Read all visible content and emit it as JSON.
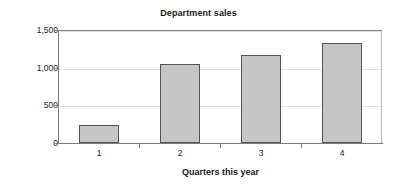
{
  "chart_data": {
    "type": "bar",
    "title": "Department sales",
    "xlabel": "Quarters this year",
    "ylabel": "Sales in thousands",
    "categories": [
      "1",
      "2",
      "3",
      "4"
    ],
    "values": [
      235,
      1045,
      1170,
      1325
    ],
    "ylim": [
      0,
      1500
    ],
    "yticks": [
      0,
      500,
      1000,
      1500
    ],
    "ytick_labels": [
      "0",
      "500",
      "1,000",
      "1,500"
    ],
    "grid": true,
    "legend": null,
    "colors": {
      "bar_fill": "#c6c6c6",
      "bar_border": "#555555",
      "gridline": "#e2e2e2",
      "axis": "#7a7a7a",
      "text": "#1a1a1a",
      "background": "#ffffff"
    }
  },
  "chart": {
    "title": "Department sales",
    "y_axis": {
      "title": "Sales in thousands",
      "ticks": [
        {
          "label": "1,500",
          "value": 1500
        },
        {
          "label": "1,000",
          "value": 1000
        },
        {
          "label": "500",
          "value": 500
        },
        {
          "label": "0",
          "value": 0
        }
      ]
    },
    "x_axis": {
      "title": "Quarters this year",
      "ticks": [
        {
          "label": "1",
          "value": 235
        },
        {
          "label": "2",
          "value": 1045
        },
        {
          "label": "3",
          "value": 1170
        },
        {
          "label": "4",
          "value": 1325
        }
      ]
    }
  }
}
